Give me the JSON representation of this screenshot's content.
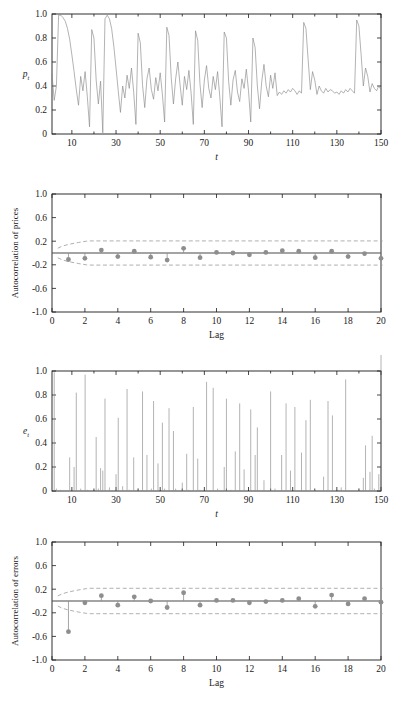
{
  "figure": {
    "title": "",
    "panel_count": 4
  },
  "panels": [
    {
      "id": "prices-series",
      "name": "Simulated price series",
      "ylabel": "p",
      "ylabel_sub": "t",
      "xlabel": "t",
      "ytick_labels": [
        "1.0",
        "0.8",
        "0.6",
        "0.4",
        "0.2",
        "0"
      ],
      "xtick_labels": [
        "10",
        "30",
        "50",
        "70",
        "90",
        "110",
        "130",
        "150"
      ]
    },
    {
      "id": "acf-prices",
      "name": "Autocorrelation of prices",
      "ylabel": "Autocorrelation of prices",
      "xlabel": "Lag",
      "ytick_labels": [
        "1.0",
        "0.6",
        "0.2",
        "-0.2",
        "-0.6",
        "-1.0"
      ],
      "xtick_labels": [
        "0",
        "2",
        "4",
        "6",
        "8",
        "10",
        "12",
        "14",
        "16",
        "18",
        "20"
      ]
    },
    {
      "id": "errors-series",
      "name": "Simulated error series",
      "ylabel": "e",
      "ylabel_sub": "t",
      "xlabel": "t",
      "ytick_labels": [
        "1.0",
        "0.8",
        "0.6",
        "0.4",
        "0.2",
        "0"
      ],
      "xtick_labels": [
        "10",
        "30",
        "50",
        "70",
        "90",
        "110",
        "130",
        "150"
      ]
    },
    {
      "id": "acf-errors",
      "name": "Autocorrelation of errors",
      "ylabel": "Autocorrelation of errors",
      "xlabel": "Lag",
      "ytick_labels": [
        "1.0",
        "0.6",
        "0.2",
        "-0.2",
        "-0.6",
        "-1.0"
      ],
      "xtick_labels": [
        "0",
        "2",
        "4",
        "6",
        "8",
        "10",
        "12",
        "14",
        "16",
        "18",
        "20"
      ]
    }
  ],
  "colors": {
    "line": "#8a8a8a",
    "axis": "#1a1a1a",
    "marker": "#8e8e8e",
    "confidence": "#9a9a9a",
    "zero_line": "#4a4a4a"
  },
  "chart_data": [
    {
      "type": "line",
      "id": "prices-series",
      "title": "",
      "xlabel": "t",
      "ylabel": "p_t",
      "xlim": [
        1,
        150
      ],
      "ylim": [
        0,
        1.0
      ],
      "xticks": [
        10,
        30,
        50,
        70,
        90,
        110,
        130,
        150
      ],
      "yticks": [
        0,
        0.2,
        0.4,
        0.6,
        0.8,
        1.0
      ],
      "grid": false,
      "legend": "none",
      "x": [
        1,
        2,
        3,
        4,
        5,
        6,
        7,
        8,
        9,
        10,
        11,
        12,
        13,
        14,
        15,
        16,
        17,
        18,
        19,
        20,
        21,
        22,
        23,
        24,
        25,
        26,
        27,
        28,
        29,
        30,
        31,
        32,
        33,
        34,
        35,
        36,
        37,
        38,
        39,
        40,
        41,
        42,
        43,
        44,
        45,
        46,
        47,
        48,
        49,
        50,
        51,
        52,
        53,
        54,
        55,
        56,
        57,
        58,
        59,
        60,
        61,
        62,
        63,
        64,
        65,
        66,
        67,
        68,
        69,
        70,
        71,
        72,
        73,
        74,
        75,
        76,
        77,
        78,
        79,
        80,
        81,
        82,
        83,
        84,
        85,
        86,
        87,
        88,
        89,
        90,
        91,
        92,
        93,
        94,
        95,
        96,
        97,
        98,
        99,
        100,
        101,
        102,
        103,
        104,
        105,
        106,
        107,
        108,
        109,
        110,
        111,
        112,
        113,
        114,
        115,
        116,
        117,
        118,
        119,
        120,
        121,
        122,
        123,
        124,
        125,
        126,
        127,
        128,
        129,
        130,
        131,
        132,
        133,
        134,
        135,
        136,
        137,
        138,
        139,
        140,
        141,
        142,
        143,
        144,
        145,
        146,
        147,
        148,
        149,
        150
      ],
      "values": [
        0.5,
        0.28,
        0.4,
        0.99,
        0.99,
        0.97,
        0.94,
        0.88,
        0.79,
        0.66,
        0.52,
        0.37,
        0.24,
        0.48,
        0.36,
        0.52,
        0.31,
        0.06,
        0.87,
        0.8,
        0.45,
        0.25,
        0.44,
        0.01,
        0.96,
        0.99,
        0.96,
        0.88,
        0.73,
        0.55,
        0.36,
        0.18,
        0.4,
        0.3,
        0.49,
        0.38,
        0.55,
        0.35,
        0.08,
        0.84,
        0.76,
        0.41,
        0.22,
        0.46,
        0.55,
        0.37,
        0.29,
        0.47,
        0.36,
        0.51,
        0.33,
        0.1,
        0.89,
        0.82,
        0.47,
        0.25,
        0.46,
        0.6,
        0.41,
        0.24,
        0.48,
        0.37,
        0.53,
        0.34,
        0.08,
        0.86,
        0.78,
        0.42,
        0.22,
        0.45,
        0.57,
        0.38,
        0.3,
        0.48,
        0.37,
        0.52,
        0.31,
        0.06,
        0.85,
        0.8,
        0.44,
        0.24,
        0.45,
        0.53,
        0.35,
        0.27,
        0.46,
        0.38,
        0.54,
        0.36,
        0.1,
        0.8,
        0.72,
        0.4,
        0.21,
        0.44,
        0.58,
        0.4,
        0.31,
        0.49,
        0.38,
        0.51,
        0.32,
        0.35,
        0.33,
        0.36,
        0.34,
        0.37,
        0.35,
        0.38,
        0.36,
        0.33,
        0.36,
        0.34,
        0.93,
        0.88,
        0.62,
        0.37,
        0.52,
        0.45,
        0.33,
        0.4,
        0.36,
        0.34,
        0.38,
        0.35,
        0.37,
        0.36,
        0.34,
        0.35,
        0.33,
        0.36,
        0.34,
        0.37,
        0.35,
        0.38,
        0.36,
        0.34,
        0.95,
        0.9,
        0.66,
        0.4,
        0.55,
        0.48,
        0.35,
        0.42,
        0.38,
        0.36,
        0.4,
        0.37,
        0.39,
        0.38,
        0.36
      ]
    },
    {
      "type": "bar",
      "id": "acf-prices",
      "title": "",
      "xlabel": "Lag",
      "ylabel": "Autocorrelation of prices",
      "xlim": [
        0,
        20
      ],
      "ylim": [
        -1.0,
        1.0
      ],
      "xticks": [
        0,
        2,
        4,
        6,
        8,
        10,
        12,
        14,
        16,
        18,
        20
      ],
      "yticks": [
        -1.0,
        -0.6,
        -0.2,
        0.2,
        0.6,
        1.0
      ],
      "grid": false,
      "legend": "none",
      "categories": [
        1,
        2,
        3,
        4,
        5,
        6,
        7,
        8,
        9,
        10,
        11,
        12,
        13,
        14,
        15,
        16,
        17,
        18,
        19,
        20
      ],
      "values": [
        -0.11,
        -0.09,
        0.05,
        -0.06,
        0.03,
        -0.07,
        -0.12,
        0.08,
        -0.08,
        0.01,
        0.0,
        -0.03,
        0.01,
        0.04,
        0.03,
        -0.08,
        0.03,
        -0.06,
        -0.01,
        -0.09
      ],
      "confidence_upper": 0.205,
      "confidence_lower": -0.205,
      "confidence_style": "dashed"
    },
    {
      "type": "line",
      "id": "errors-series",
      "title": "",
      "xlabel": "t",
      "ylabel": "e_t",
      "xlim": [
        1,
        150
      ],
      "ylim": [
        0,
        1.0
      ],
      "xticks": [
        10,
        30,
        50,
        70,
        90,
        110,
        130,
        150
      ],
      "yticks": [
        0,
        0.2,
        0.4,
        0.6,
        0.8,
        1.0
      ],
      "grid": false,
      "legend": "none",
      "x": [
        1,
        2,
        3,
        4,
        5,
        6,
        7,
        8,
        9,
        10,
        11,
        12,
        13,
        14,
        15,
        16,
        17,
        18,
        19,
        20,
        21,
        22,
        23,
        24,
        25,
        26,
        27,
        28,
        29,
        30,
        31,
        32,
        33,
        34,
        35,
        36,
        37,
        38,
        39,
        40,
        41,
        42,
        43,
        44,
        45,
        46,
        47,
        48,
        49,
        50,
        51,
        52,
        53,
        54,
        55,
        56,
        57,
        58,
        59,
        60,
        61,
        62,
        63,
        64,
        65,
        66,
        67,
        68,
        69,
        70,
        71,
        72,
        73,
        74,
        75,
        76,
        77,
        78,
        79,
        80,
        81,
        82,
        83,
        84,
        85,
        86,
        87,
        88,
        89,
        90,
        91,
        92,
        93,
        94,
        95,
        96,
        97,
        98,
        99,
        100,
        101,
        102,
        103,
        104,
        105,
        106,
        107,
        108,
        109,
        110,
        111,
        112,
        113,
        114,
        115,
        116,
        117,
        118,
        119,
        120,
        121,
        122,
        123,
        124,
        125,
        126,
        127,
        128,
        129,
        130,
        131,
        132,
        133,
        134,
        135,
        136,
        137,
        138,
        139,
        140,
        141,
        142,
        143,
        144,
        145,
        146,
        147,
        148,
        149,
        150
      ],
      "values": [
        0.0,
        0.99,
        0.02,
        0.0,
        0.01,
        0.0,
        0.0,
        0.0,
        0.28,
        0.0,
        0.2,
        0.82,
        0.0,
        0.02,
        0.0,
        0.97,
        0.01,
        0.0,
        0.0,
        0.0,
        0.45,
        0.02,
        0.19,
        0.17,
        0.77,
        0.0,
        0.03,
        0.0,
        0.0,
        0.14,
        0.61,
        0.0,
        0.04,
        0.0,
        0.85,
        0.01,
        0.0,
        0.28,
        0.0,
        0.02,
        0.0,
        0.83,
        0.0,
        0.3,
        0.0,
        0.02,
        0.75,
        0.0,
        0.23,
        0.0,
        0.57,
        0.02,
        0.0,
        0.69,
        0.0,
        0.5,
        0.02,
        0.0,
        0.0,
        0.07,
        0.0,
        0.31,
        0.01,
        0.0,
        0.7,
        0.0,
        0.27,
        0.01,
        0.0,
        0.0,
        0.91,
        0.0,
        0.0,
        0.86,
        0.0,
        0.02,
        0.0,
        0.0,
        0.2,
        0.77,
        0.0,
        0.01,
        0.0,
        0.33,
        0.0,
        0.73,
        0.0,
        0.18,
        0.0,
        0.0,
        0.68,
        0.0,
        0.3,
        0.53,
        0.0,
        0.0,
        0.09,
        0.0,
        0.0,
        0.83,
        0.0,
        0.02,
        0.0,
        0.0,
        0.3,
        0.0,
        0.73,
        0.0,
        0.17,
        0.0,
        0.7,
        0.0,
        0.0,
        0.32,
        0.0,
        0.59,
        0.0,
        0.76,
        0.0,
        0.01,
        0.0,
        0.0,
        0.0,
        0.12,
        0.0,
        0.75,
        0.0,
        0.63,
        0.0,
        0.0,
        0.01,
        0.03,
        0.0,
        0.93,
        0.0,
        0.0,
        0.0,
        0.0,
        0.0,
        0.02,
        0.0,
        0.11,
        0.38,
        0.0,
        0.16,
        0.46,
        0.02,
        0.0,
        0.14
      ],
      "style": "impulse"
    },
    {
      "type": "bar",
      "id": "acf-errors",
      "title": "",
      "xlabel": "Lag",
      "ylabel": "Autocorrelation of errors",
      "xlim": [
        0,
        20
      ],
      "ylim": [
        -1.0,
        1.0
      ],
      "xticks": [
        0,
        2,
        4,
        6,
        8,
        10,
        12,
        14,
        16,
        18,
        20
      ],
      "yticks": [
        -1.0,
        -0.6,
        -0.2,
        0.2,
        0.6,
        1.0
      ],
      "grid": false,
      "legend": "none",
      "categories": [
        1,
        2,
        3,
        4,
        5,
        6,
        7,
        8,
        9,
        10,
        11,
        12,
        13,
        14,
        15,
        16,
        17,
        18,
        19,
        20
      ],
      "values": [
        -0.52,
        -0.03,
        0.09,
        -0.07,
        0.07,
        0.0,
        -0.11,
        0.14,
        -0.07,
        0.01,
        0.01,
        -0.03,
        -0.01,
        0.01,
        0.04,
        -0.09,
        0.1,
        -0.05,
        0.04,
        -0.02
      ],
      "confidence_upper": 0.215,
      "confidence_lower": -0.215,
      "confidence_style": "dashed"
    }
  ]
}
